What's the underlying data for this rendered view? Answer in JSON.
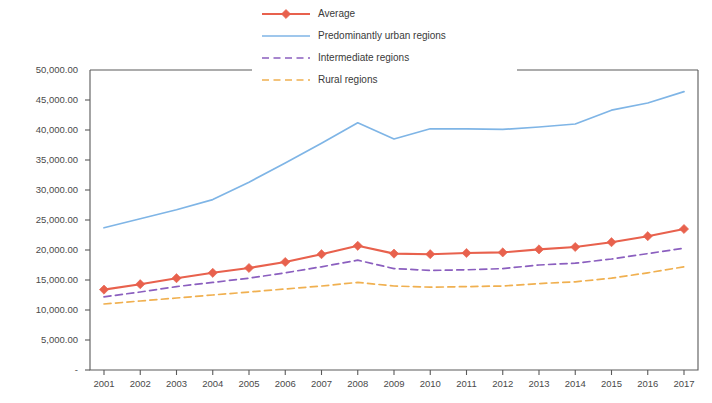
{
  "chart_data": {
    "type": "line",
    "title": "",
    "xlabel": "",
    "ylabel": "",
    "x": [
      2001,
      2002,
      2003,
      2004,
      2005,
      2006,
      2007,
      2008,
      2009,
      2010,
      2011,
      2012,
      2013,
      2014,
      2015,
      2016,
      2017
    ],
    "categories": [
      "2001",
      "2002",
      "2003",
      "2004",
      "2005",
      "2006",
      "2007",
      "2008",
      "2009",
      "2010",
      "2011",
      "2012",
      "2013",
      "2014",
      "2015",
      "2016",
      "2017"
    ],
    "ylim": [
      0,
      50000
    ],
    "ytick_values": [
      0,
      5000,
      10000,
      15000,
      20000,
      25000,
      30000,
      35000,
      40000,
      45000,
      50000
    ],
    "ytick_labels": [
      "-",
      "5,000.00",
      "10,000.00",
      "15,000.00",
      "20,000.00",
      "25,000.00",
      "30,000.00",
      "35,000.00",
      "40,000.00",
      "45,000.00",
      "50,000.00"
    ],
    "grid": false,
    "legend_position": "top-center",
    "series": [
      {
        "name": "Average",
        "color": "#E8614D",
        "style": "solid",
        "marker": "diamond",
        "values": [
          13400,
          14300,
          15300,
          16200,
          17000,
          18000,
          19300,
          20700,
          19400,
          19300,
          19500,
          19600,
          20100,
          20500,
          21300,
          22300,
          23500
        ]
      },
      {
        "name": "Predominantly urban regions",
        "color": "#7FB5E6",
        "style": "solid",
        "marker": "none",
        "values": [
          23700,
          25200,
          26700,
          28400,
          31300,
          34500,
          37800,
          41200,
          38500,
          40200,
          40200,
          40100,
          40500,
          41000,
          43300,
          44500,
          46400
        ]
      },
      {
        "name": "Intermediate regions",
        "color": "#8B5FBF",
        "style": "dashed",
        "marker": "none",
        "values": [
          12200,
          13000,
          13900,
          14600,
          15300,
          16200,
          17200,
          18300,
          16900,
          16600,
          16700,
          16900,
          17500,
          17800,
          18500,
          19400,
          20300
        ]
      },
      {
        "name": "Rural regions",
        "color": "#F0B050",
        "style": "dashed",
        "marker": "none",
        "values": [
          11000,
          11500,
          12000,
          12500,
          13000,
          13500,
          14000,
          14600,
          14000,
          13800,
          13900,
          14000,
          14400,
          14700,
          15300,
          16200,
          17200
        ]
      }
    ]
  },
  "legend": {
    "items": [
      {
        "label": "Average"
      },
      {
        "label": "Predominantly urban regions"
      },
      {
        "label": "Intermediate regions"
      },
      {
        "label": "Rural regions"
      }
    ]
  }
}
